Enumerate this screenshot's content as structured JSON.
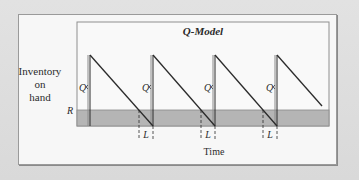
{
  "diagram": {
    "title": "Q-Model",
    "y_axis_label_lines": [
      "Inventory",
      "on",
      "hand"
    ],
    "x_axis_label": "Time",
    "reorder_point_label": "R",
    "order_quantity_label": "Q",
    "lead_time_label": "L",
    "cycles": 4,
    "colors": {
      "background": "#dedede",
      "panel": "#f7f7f7",
      "frame": "#8a8a8a",
      "safety_band": "#b5b5b5",
      "line": "#2b2b2b"
    }
  }
}
